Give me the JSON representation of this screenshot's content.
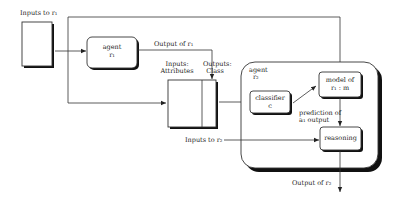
{
  "diagram": {
    "labels": {
      "inputs_r1": "Inputs to r₁",
      "output_r1": "Output of r₁",
      "inputs_attributes": [
        "Inputs:",
        "Attributes"
      ],
      "outputs_class": [
        "Outputs:",
        "Class"
      ],
      "agent_r2": [
        "agent",
        "r₂"
      ],
      "prediction": [
        "prediction of",
        "a₁ output"
      ],
      "inputs_r2": "Inputs to r₂",
      "output_r2": "Output of r₂"
    },
    "nodes": {
      "agent_r1": [
        "agent",
        "r₁"
      ],
      "classifier": [
        "classifier",
        "c"
      ],
      "model": [
        "model of",
        "r₁ : m"
      ],
      "reasoning": "reasoning"
    },
    "colors": {
      "stroke": "#333333",
      "shadow": "#111111",
      "background": "#ffffff"
    }
  }
}
